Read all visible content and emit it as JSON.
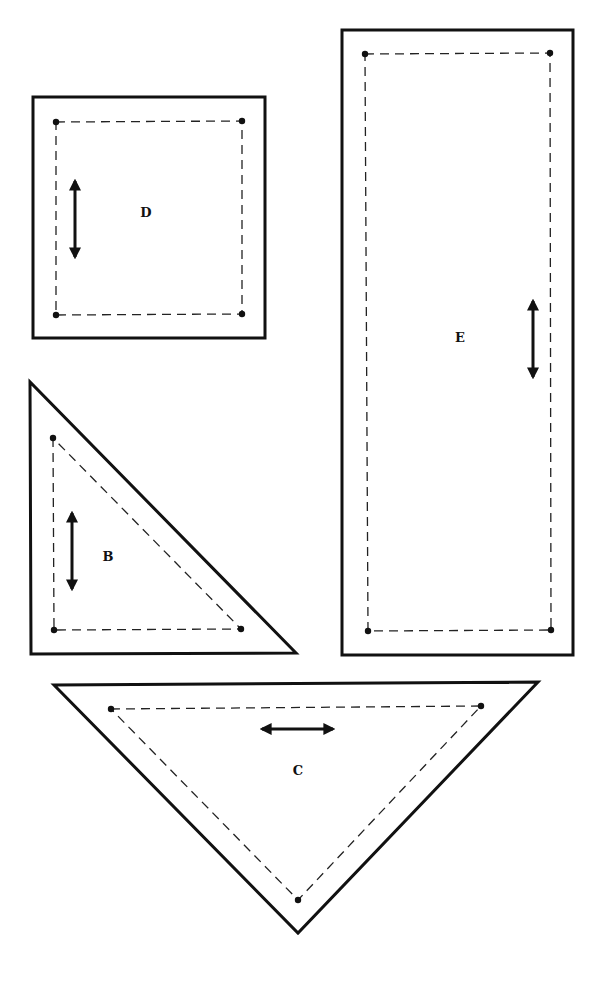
{
  "diagram": {
    "type": "sewing-pattern-pieces",
    "colors": {
      "outline": "#111111",
      "background": "#ffffff"
    },
    "legend": {
      "solid_line": "cutting line",
      "dashed_line": "seam line",
      "dot": "seam corner point",
      "double_arrow": "grain line"
    },
    "pieces": [
      {
        "id": "D",
        "label": "D",
        "shape": "square",
        "grain": "vertical"
      },
      {
        "id": "E",
        "label": "E",
        "shape": "rectangle",
        "grain": "vertical"
      },
      {
        "id": "B",
        "label": "B",
        "shape": "right-triangle",
        "grain": "vertical"
      },
      {
        "id": "C",
        "label": "C",
        "shape": "isosceles-right-triangle",
        "grain": "horizontal"
      }
    ]
  }
}
